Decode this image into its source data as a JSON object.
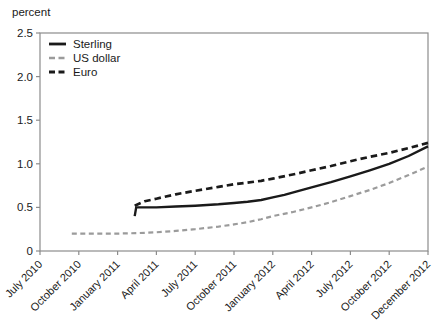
{
  "chart_data": {
    "type": "line",
    "title": "",
    "unit_label": "percent",
    "xlabel": "",
    "ylabel": "percent",
    "ylim": [
      0,
      2.5
    ],
    "y_ticks": [
      0,
      0.5,
      1.0,
      1.5,
      2.0,
      2.5
    ],
    "y_tick_labels": [
      "0",
      "0.5",
      "1.0",
      "1.5",
      "2.0",
      "2.5"
    ],
    "x_tick_labels": [
      "July 2010",
      "October 2010",
      "January 2011",
      "April 2011",
      "July 2011",
      "October 2011",
      "January 2012",
      "April 2012",
      "July 2012",
      "October 2012",
      "December 2012"
    ],
    "grid": false,
    "legend_position": "top-left-inside",
    "axis_color": "#8c8c8c",
    "text_color": "#1a1a1a",
    "series": [
      {
        "name": "Sterling",
        "color": "#1a1a1a",
        "dash": "solid",
        "width": 2.4,
        "points": [
          [
            2.44,
            0.4
          ],
          [
            2.48,
            0.5
          ],
          [
            3.0,
            0.5
          ],
          [
            3.5,
            0.51
          ],
          [
            4.0,
            0.52
          ],
          [
            4.6,
            0.535
          ],
          [
            5.0,
            0.55
          ],
          [
            5.35,
            0.565
          ],
          [
            5.7,
            0.585
          ],
          [
            6.0,
            0.615
          ],
          [
            6.3,
            0.645
          ],
          [
            6.6,
            0.68
          ],
          [
            7.0,
            0.73
          ],
          [
            7.5,
            0.79
          ],
          [
            8.0,
            0.855
          ],
          [
            8.5,
            0.925
          ],
          [
            9.0,
            1.0
          ],
          [
            9.5,
            1.09
          ],
          [
            10.0,
            1.2
          ]
        ]
      },
      {
        "name": "US dollar",
        "color": "#9b9b9b",
        "dash": "5,3.5",
        "width": 2.2,
        "points": [
          [
            0.82,
            0.2
          ],
          [
            1.5,
            0.2
          ],
          [
            2.0,
            0.2
          ],
          [
            2.5,
            0.205
          ],
          [
            3.0,
            0.215
          ],
          [
            3.5,
            0.23
          ],
          [
            4.0,
            0.25
          ],
          [
            4.6,
            0.28
          ],
          [
            5.0,
            0.305
          ],
          [
            5.35,
            0.33
          ],
          [
            5.7,
            0.365
          ],
          [
            6.0,
            0.4
          ],
          [
            6.5,
            0.445
          ],
          [
            7.0,
            0.5
          ],
          [
            7.5,
            0.56
          ],
          [
            8.0,
            0.63
          ],
          [
            8.5,
            0.7
          ],
          [
            9.0,
            0.78
          ],
          [
            9.5,
            0.87
          ],
          [
            10.0,
            0.97
          ]
        ]
      },
      {
        "name": "Euro",
        "color": "#1a1a1a",
        "dash": "6.5,4",
        "width": 2.7,
        "points": [
          [
            2.44,
            0.52
          ],
          [
            2.7,
            0.57
          ],
          [
            3.0,
            0.6
          ],
          [
            3.5,
            0.65
          ],
          [
            4.0,
            0.69
          ],
          [
            4.6,
            0.735
          ],
          [
            5.0,
            0.765
          ],
          [
            5.7,
            0.805
          ],
          [
            6.0,
            0.83
          ],
          [
            6.6,
            0.885
          ],
          [
            7.0,
            0.925
          ],
          [
            7.5,
            0.975
          ],
          [
            8.0,
            1.03
          ],
          [
            8.5,
            1.08
          ],
          [
            9.0,
            1.125
          ],
          [
            9.5,
            1.18
          ],
          [
            10.0,
            1.24
          ]
        ]
      }
    ]
  }
}
